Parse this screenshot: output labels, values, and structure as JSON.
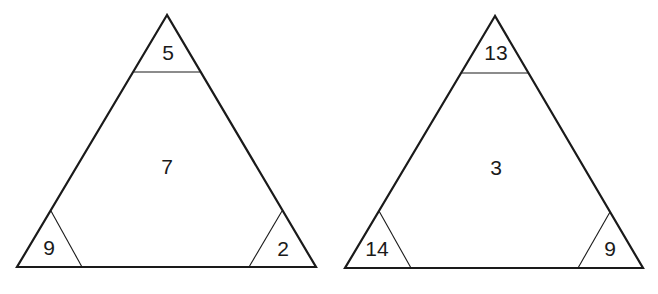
{
  "puzzle": {
    "triangles": [
      {
        "top": "5",
        "center": "7",
        "bottom_left": "9",
        "bottom_right": "2"
      },
      {
        "top": "13",
        "center": "3",
        "bottom_left": "14",
        "bottom_right": "9"
      }
    ]
  }
}
